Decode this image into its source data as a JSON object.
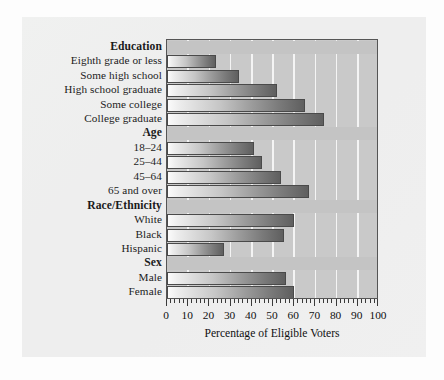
{
  "chart_data": {
    "type": "bar",
    "orientation": "horizontal",
    "title": "",
    "xlabel": "Percentage of Eligible Voters",
    "ylabel": "",
    "xlim": [
      0,
      100
    ],
    "xticks": [
      0,
      10,
      20,
      30,
      40,
      50,
      60,
      70,
      80,
      90,
      100
    ],
    "xtick_labels": [
      "0",
      "10",
      "20",
      "30",
      "40",
      "50",
      "60",
      "70",
      "80",
      "90",
      "100"
    ],
    "minor_tick_step": 2,
    "grid": true,
    "grid_axis": "x",
    "legend": "none",
    "sections": [
      {
        "header": "Education",
        "categories": [
          "Eighth grade or less",
          "Some high school",
          "High school graduate",
          "Some college",
          "College graduate"
        ],
        "values": [
          23,
          34,
          52,
          65,
          74
        ]
      },
      {
        "header": "Age",
        "categories": [
          "18–24",
          "25–44",
          "45–64",
          "65 and over"
        ],
        "values": [
          41,
          45,
          54,
          67
        ]
      },
      {
        "header": "Race/Ethnicity",
        "categories": [
          "White",
          "Black",
          "Hispanic"
        ],
        "values": [
          60,
          55,
          27
        ]
      },
      {
        "header": "Sex",
        "categories": [
          "Male",
          "Female"
        ],
        "values": [
          56,
          60
        ]
      }
    ],
    "categories": [
      "Eighth grade or less",
      "Some high school",
      "High school graduate",
      "Some college",
      "College graduate",
      "18–24",
      "25–44",
      "45–64",
      "65 and over",
      "White",
      "Black",
      "Hispanic",
      "Male",
      "Female"
    ],
    "values": [
      23,
      34,
      52,
      65,
      74,
      41,
      45,
      54,
      67,
      60,
      55,
      27,
      56,
      60
    ],
    "colors": {
      "bar_gradient_start": "#fbfbfb",
      "bar_gradient_end": "#5f5f5f",
      "bar_outline": "#4a4a4a",
      "plot_background": "#c9c9c9",
      "gridline": "#f4f4f4",
      "panel_background": "#ececec",
      "axis": "#555555",
      "text": "#111111"
    }
  }
}
